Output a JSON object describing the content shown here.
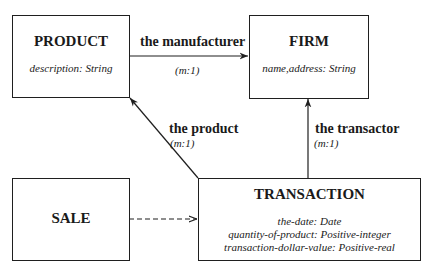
{
  "diagram": {
    "entities": [
      {
        "id": "product",
        "name": "PRODUCT",
        "attributes": [
          "description: String"
        ]
      },
      {
        "id": "firm",
        "name": "FIRM",
        "attributes": [
          "name,address: String"
        ]
      },
      {
        "id": "sale",
        "name": "SALE",
        "attributes": []
      },
      {
        "id": "transaction",
        "name": "TRANSACTION",
        "attributes": [
          "the-date: Date",
          "quantity-of-product: Positive-integer",
          "transaction-dollar-value: Positive-real"
        ]
      }
    ],
    "relationships": [
      {
        "from": "PRODUCT",
        "to": "FIRM",
        "label": "the manufacturer",
        "cardinality": "(m:1)",
        "style": "solid"
      },
      {
        "from": "TRANSACTION",
        "to": "PRODUCT",
        "label": "the product",
        "cardinality": "(m:1)",
        "style": "solid"
      },
      {
        "from": "TRANSACTION",
        "to": "FIRM",
        "label": "the transactor",
        "cardinality": "(m:1)",
        "style": "solid"
      },
      {
        "from": "SALE",
        "to": "TRANSACTION",
        "label": "",
        "cardinality": "",
        "style": "dashed"
      }
    ]
  }
}
